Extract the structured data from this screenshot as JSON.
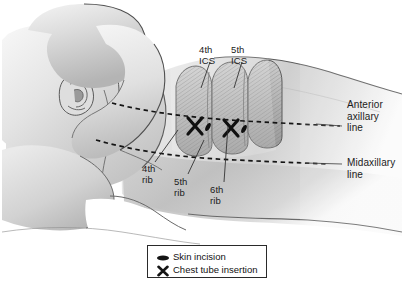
{
  "figure": {
    "background_color": "#ffffff"
  },
  "annotations": {
    "ics": [
      {
        "id": "ics-4",
        "line1": "4th",
        "line2": "ICS",
        "x": 203,
        "y": 47
      },
      {
        "id": "ics-5",
        "line1": "5th",
        "line2": "ICS",
        "x": 235,
        "y": 47
      }
    ],
    "ribs": [
      {
        "id": "rib-4",
        "line1": "4th",
        "line2": "rib",
        "x": 146,
        "y": 166
      },
      {
        "id": "rib-5",
        "line1": "5th",
        "line2": "rib",
        "x": 177,
        "y": 178
      },
      {
        "id": "rib-6",
        "line1": "6th",
        "line2": "rib",
        "x": 212,
        "y": 186
      }
    ],
    "lines": [
      {
        "id": "anterior-axillary-line",
        "line1": "Anterior",
        "line2": "axillary",
        "line3": "line",
        "x": 345,
        "y": 101
      },
      {
        "id": "midaxillary-line",
        "line1": "Midaxillary",
        "line2": "line",
        "line3": "",
        "x": 345,
        "y": 158
      }
    ]
  },
  "legend": {
    "items": [
      {
        "id": "skin-incision",
        "icon": "ellipse-icon",
        "label": "Skin incision"
      },
      {
        "id": "chest-tube-insertion",
        "icon": "x-mark-icon",
        "label": "Chest tube insertion"
      }
    ]
  },
  "colors": {
    "ink": "#1b1b1b",
    "skin_light": "#f2f2f2",
    "skin_mid": "#d8d8d8",
    "skin_dark": "#a8a8a8",
    "rib_fill": "#bdbdbd",
    "outline": "#4a4a4a",
    "legend_border": "#2a2a2a"
  }
}
